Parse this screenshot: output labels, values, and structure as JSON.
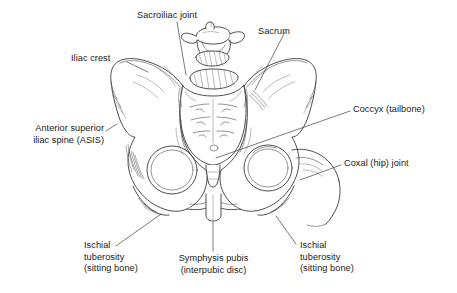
{
  "figure": {
    "background_color": "#ffffff",
    "ink_color": "#3a3a3a",
    "text_color": "#1a1a1a",
    "width": 457,
    "height": 293
  },
  "labels": {
    "sacroiliac_joint": "Sacroiliac joint",
    "sacrum": "Sacrum",
    "iliac_crest": "Iliac crest",
    "asis_line1": "Anterior superior",
    "asis_line2": "iliac spine (ASIS)",
    "coccyx": "Coccyx (tailbone)",
    "coxal_joint": "Coxal (hip) joint",
    "ischial_left_line1": "Ischial",
    "ischial_left_line2": "tuberosity",
    "ischial_left_line3": "(sitting bone)",
    "symphysis_line1": "Symphysis pubis",
    "symphysis_line2": "(interpubic disc)",
    "ischial_right_line1": "Ischial",
    "ischial_right_line2": "tuberosity",
    "ischial_right_line3": "(sitting bone)"
  },
  "structures": [
    {
      "name": "lumbar-vertebra-l5",
      "label": null
    },
    {
      "name": "sacrum",
      "label": "Sacrum"
    },
    {
      "name": "coccyx",
      "label": "Coccyx (tailbone)"
    },
    {
      "name": "left-ilium",
      "label": "Iliac crest"
    },
    {
      "name": "right-ilium",
      "label": "Iliac crest"
    },
    {
      "name": "left-obturator-foramen",
      "label": null
    },
    {
      "name": "right-obturator-foramen",
      "label": null
    },
    {
      "name": "pubic-symphysis",
      "label": "Symphysis pubis (interpubic disc)"
    },
    {
      "name": "left-ischial-tuberosity",
      "label": "Ischial tuberosity (sitting bone)"
    },
    {
      "name": "right-ischial-tuberosity",
      "label": "Ischial tuberosity (sitting bone)"
    },
    {
      "name": "left-hip-joint",
      "label": "Coxal (hip) joint"
    },
    {
      "name": "right-hip-joint",
      "label": "Coxal (hip) joint"
    },
    {
      "name": "sacroiliac-joint",
      "label": "Sacroiliac joint"
    }
  ]
}
